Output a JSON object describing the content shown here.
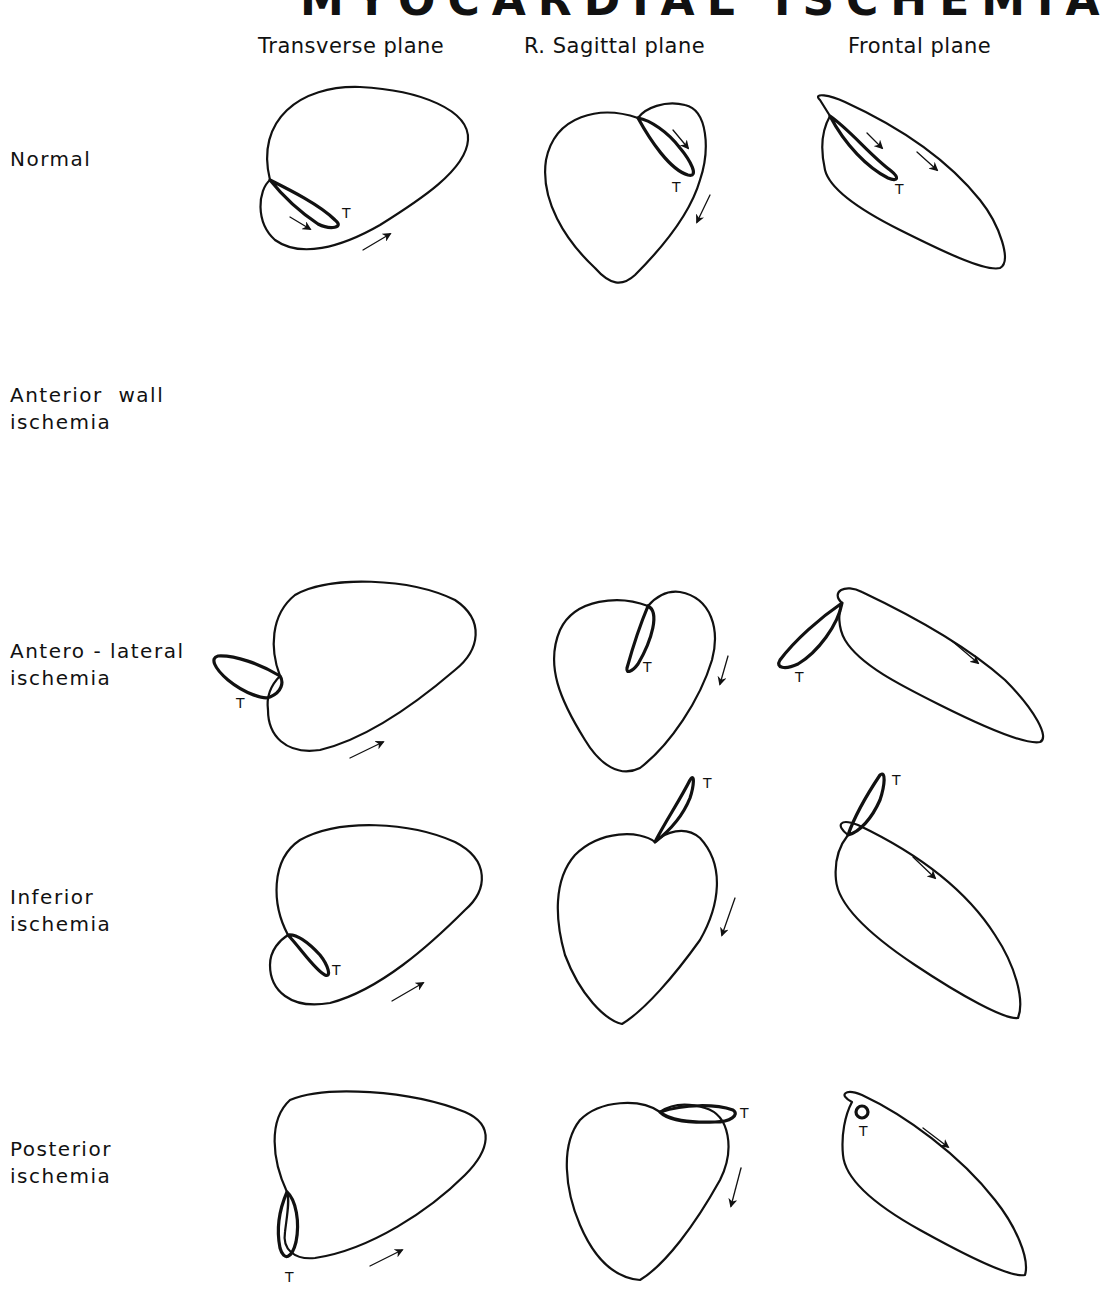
{
  "figure": {
    "title": "MYOCARDIAL ISCHEMIA",
    "columns": [
      {
        "label": "Transverse plane"
      },
      {
        "label": "R. Sagittal plane"
      },
      {
        "label": "Frontal plane"
      }
    ],
    "rows": [
      {
        "label_line1": "Normal",
        "label_line2": ""
      },
      {
        "label_line1": "Anterior  wall",
        "label_line2": "ischemia"
      },
      {
        "label_line1": "Antero - lateral",
        "label_line2": "ischemia"
      },
      {
        "label_line1": "Inferior",
        "label_line2": "ischemia"
      },
      {
        "label_line1": "Posterior",
        "label_line2": "ischemia"
      }
    ],
    "loop_marker": "T",
    "colors": {
      "stroke": "#111111",
      "background": "#ffffff"
    }
  }
}
